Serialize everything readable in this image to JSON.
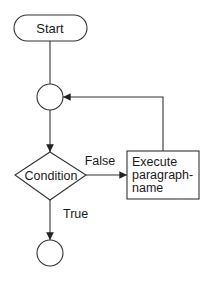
{
  "diagram": {
    "type": "flowchart",
    "nodes": {
      "start": {
        "shape": "terminal",
        "label": "Start"
      },
      "connector_top": {
        "shape": "connector-circle",
        "label": ""
      },
      "condition": {
        "shape": "decision-diamond",
        "label": "Condition"
      },
      "execute": {
        "shape": "process-box",
        "lines": [
          "Execute",
          "paragraph-",
          "name"
        ]
      },
      "connector_end": {
        "shape": "connector-circle",
        "label": ""
      }
    },
    "edges": {
      "false_label": "False",
      "true_label": "True"
    },
    "colors": {
      "stroke": "#333333",
      "text": "#1a1a1a",
      "background": "#ffffff"
    }
  }
}
